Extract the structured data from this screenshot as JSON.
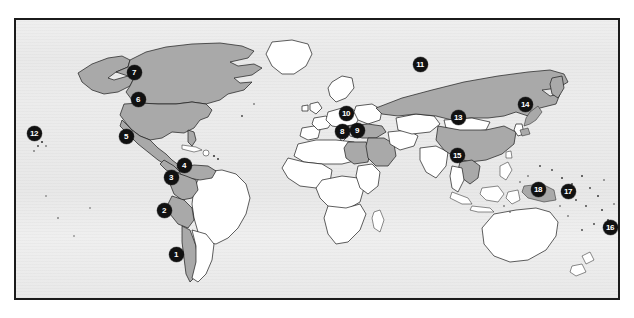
{
  "figure": {
    "kind": "world-map",
    "frame": {
      "x": 14,
      "y": 18,
      "width": 606,
      "height": 282
    },
    "colors": {
      "ocean": "#ebebeb",
      "land_plain": "#ffffff",
      "land_shaded": "#a9a9a9",
      "outline": "#1a1a1a",
      "frame_border": "#1b1b1b",
      "marker_fill": "#111111",
      "marker_text": "#ffffff",
      "page_background": "#ffffff"
    }
  },
  "markers": [
    {
      "label": "1",
      "x": 176,
      "y": 254,
      "region": "chile"
    },
    {
      "label": "2",
      "x": 164,
      "y": 210,
      "region": "peru"
    },
    {
      "label": "3",
      "x": 171,
      "y": 177,
      "region": "colombia"
    },
    {
      "label": "4",
      "x": 184,
      "y": 165,
      "region": "venezuela"
    },
    {
      "label": "5",
      "x": 126,
      "y": 136,
      "region": "mexico"
    },
    {
      "label": "6",
      "x": 138,
      "y": 99,
      "region": "united-states"
    },
    {
      "label": "7",
      "x": 134,
      "y": 72,
      "region": "canada"
    },
    {
      "label": "8",
      "x": 342,
      "y": 131,
      "region": "egypt"
    },
    {
      "label": "9",
      "x": 357,
      "y": 130,
      "region": "iraq-saudi-arabia"
    },
    {
      "label": "10",
      "x": 346,
      "y": 113,
      "region": "turkey-syria"
    },
    {
      "label": "11",
      "x": 420,
      "y": 64,
      "region": "russia"
    },
    {
      "label": "12",
      "x": 34,
      "y": 133,
      "region": "hawaii"
    },
    {
      "label": "13",
      "x": 458,
      "y": 117,
      "region": "china"
    },
    {
      "label": "14",
      "x": 525,
      "y": 104,
      "region": "japan"
    },
    {
      "label": "15",
      "x": 457,
      "y": 155,
      "region": "vietnam"
    },
    {
      "label": "16",
      "x": 610,
      "y": 227,
      "region": "pacific-island-east"
    },
    {
      "label": "17",
      "x": 568,
      "y": 191,
      "region": "solomon-islands"
    },
    {
      "label": "18",
      "x": 538,
      "y": 189,
      "region": "papua-new-guinea"
    }
  ],
  "shaded_regions": [
    "canada",
    "united-states",
    "mexico",
    "colombia",
    "venezuela",
    "peru",
    "chile",
    "russia",
    "china",
    "japan",
    "turkey",
    "syria",
    "iraq",
    "saudi-arabia",
    "egypt",
    "vietnam",
    "papua-new-guinea"
  ]
}
